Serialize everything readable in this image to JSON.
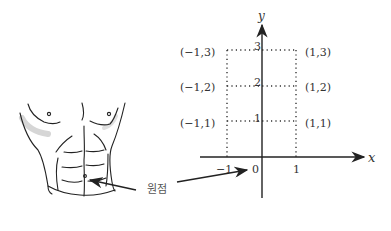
{
  "diagram": {
    "origin_label": "원점",
    "axes": {
      "x_label": "x",
      "y_label": "y",
      "x_ticks": [
        "−1",
        "0",
        "1"
      ],
      "y_ticks": [
        "1",
        "2",
        "3"
      ]
    },
    "points": [
      {
        "label": "(−1,3)"
      },
      {
        "label": "(−1,2)"
      },
      {
        "label": "(−1,1)"
      },
      {
        "label": "(1,3)"
      },
      {
        "label": "(1,2)"
      },
      {
        "label": "(1,1)"
      }
    ],
    "colors": {
      "axis": "#222222",
      "grid_dotted": "#333333",
      "text": "#333333",
      "torso_line": "#222222",
      "shadow": "#d8d8d8"
    }
  }
}
